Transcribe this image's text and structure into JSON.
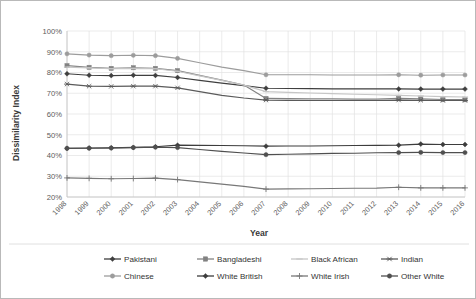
{
  "chart_data": {
    "type": "line",
    "title": "",
    "xlabel": "Year",
    "ylabel": "Dissimilarity Index",
    "grid": true,
    "legend_position": "bottom",
    "ylim": [
      20,
      100
    ],
    "ytick_labels": [
      "100%",
      "90%",
      "80%",
      "70%",
      "60%",
      "50%",
      "40%",
      "30%",
      "20%"
    ],
    "ytick_values": [
      100,
      90,
      80,
      70,
      60,
      50,
      40,
      30,
      20
    ],
    "categories": [
      "1998",
      "1999",
      "2000",
      "2001",
      "2002",
      "2003",
      "2004",
      "2005",
      "2006",
      "2007",
      "2008",
      "2009",
      "2010",
      "2011",
      "2012",
      "2013",
      "2014",
      "2015",
      "2016"
    ],
    "marker_years": [
      "1998",
      "1999",
      "2000",
      "2001",
      "2002",
      "2003",
      "2007",
      "2013",
      "2014",
      "2015",
      "2016"
    ],
    "series": [
      {
        "name": "Pakistani",
        "color": "#3f3f3f",
        "marker": "diamond",
        "values": [
          79.4,
          78.7,
          78.5,
          78.7,
          78.6,
          77.6,
          76.2,
          74.9,
          73.7,
          72.4,
          72.3,
          72.2,
          72.1,
          72.1,
          72.1,
          72.1,
          72.0,
          72.0,
          72.0
        ]
      },
      {
        "name": "Bangladeshi",
        "color": "#828282",
        "marker": "square",
        "values": [
          83.3,
          82.5,
          82.0,
          82.3,
          82.0,
          80.9,
          78.6,
          76.3,
          74.0,
          67.5,
          67.4,
          67.3,
          67.3,
          67.2,
          67.2,
          67.5,
          67.3,
          67.0,
          66.9
        ]
      },
      {
        "name": "Black African",
        "color": "#c6c6c6",
        "marker": "line",
        "values": [
          82.6,
          82.2,
          81.8,
          82.0,
          81.8,
          80.6,
          78.4,
          76.2,
          73.9,
          70.8,
          70.4,
          70.1,
          69.8,
          69.5,
          69.3,
          69.0,
          68.7,
          68.4,
          68.2
        ]
      },
      {
        "name": "Indian",
        "color": "#5a5a5a",
        "marker": "asterisk",
        "values": [
          74.4,
          73.4,
          73.3,
          73.4,
          73.4,
          72.6,
          70.8,
          69.0,
          67.7,
          66.7,
          66.6,
          66.5,
          66.5,
          66.5,
          66.5,
          66.7,
          66.6,
          66.5,
          66.5
        ]
      },
      {
        "name": "Chinese",
        "color": "#9c9c9c",
        "marker": "circle",
        "values": [
          89.0,
          88.4,
          88.1,
          88.3,
          88.1,
          86.8,
          84.7,
          82.6,
          80.9,
          78.9,
          78.9,
          78.9,
          78.8,
          78.8,
          78.8,
          78.9,
          78.7,
          78.8,
          78.8
        ]
      },
      {
        "name": "White British",
        "color": "#3d3d3d",
        "marker": "diamond",
        "values": [
          43.5,
          43.6,
          43.7,
          43.9,
          44.2,
          45.0,
          44.9,
          44.8,
          44.7,
          44.5,
          44.6,
          44.6,
          44.7,
          44.8,
          44.9,
          45.0,
          45.5,
          45.3,
          45.3
        ]
      },
      {
        "name": "White Irish",
        "color": "#787878",
        "marker": "plus",
        "values": [
          29.2,
          29.0,
          28.8,
          28.9,
          29.1,
          28.4,
          27.3,
          26.2,
          25.1,
          23.8,
          23.9,
          24.0,
          24.1,
          24.2,
          24.3,
          24.7,
          24.4,
          24.4,
          24.4
        ]
      },
      {
        "name": "Other White",
        "color": "#4f4f4f",
        "marker": "circle",
        "values": [
          43.4,
          43.5,
          43.6,
          43.8,
          44.0,
          43.8,
          42.9,
          42.0,
          41.2,
          40.4,
          40.6,
          40.8,
          41.0,
          41.1,
          41.3,
          41.4,
          41.5,
          41.4,
          41.4
        ]
      }
    ]
  },
  "legend": {
    "rows": [
      [
        "Pakistani",
        "Bangladeshi",
        "Black African",
        "Indian"
      ],
      [
        "Chinese",
        "White British",
        "White Irish",
        "Other White"
      ]
    ]
  }
}
